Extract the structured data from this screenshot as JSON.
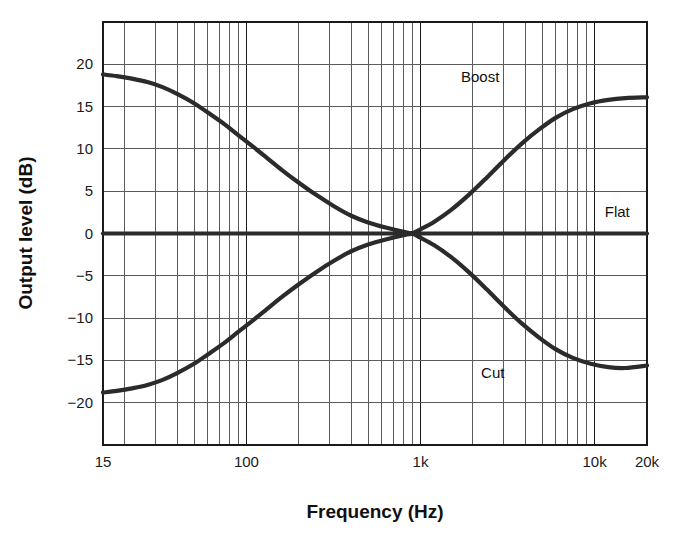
{
  "chart_data": {
    "type": "line",
    "title": "",
    "xlabel": "Frequency (Hz)",
    "ylabel": "Output level (dB)",
    "xscale": "log",
    "xlim": [
      15,
      20000
    ],
    "ylim": [
      -25,
      25
    ],
    "grid": true,
    "legend_position": "inline-annotations",
    "x_tick_labels": [
      "15",
      "100",
      "1k",
      "10k",
      "20k"
    ],
    "x_tick_values": [
      15,
      100,
      1000,
      10000,
      20000
    ],
    "y_tick_labels": [
      "20",
      "15",
      "10",
      "5",
      "0",
      "−5",
      "−10",
      "−15",
      "−20"
    ],
    "y_tick_values": [
      20,
      15,
      10,
      5,
      0,
      -5,
      -10,
      -15,
      -20
    ],
    "x_minor_gridlines": [
      20,
      30,
      40,
      50,
      60,
      70,
      80,
      90,
      200,
      300,
      400,
      500,
      600,
      700,
      800,
      900,
      2000,
      3000,
      4000,
      5000,
      6000,
      7000,
      8000,
      9000
    ],
    "annotations": [
      {
        "text": "Boost",
        "x": 2200,
        "y": 18.5
      },
      {
        "text": "Flat",
        "x": 13500,
        "y": 2.6
      },
      {
        "text": "Cut",
        "x": 2600,
        "y": -16.5
      }
    ],
    "series": [
      {
        "name": "Boost",
        "color": "#2b2b2b",
        "points": [
          [
            15,
            18.8
          ],
          [
            18,
            18.6
          ],
          [
            22,
            18.3
          ],
          [
            27,
            17.9
          ],
          [
            33,
            17.3
          ],
          [
            40,
            16.5
          ],
          [
            50,
            15.4
          ],
          [
            60,
            14.3
          ],
          [
            75,
            12.9
          ],
          [
            90,
            11.6
          ],
          [
            110,
            10.2
          ],
          [
            130,
            9.0
          ],
          [
            160,
            7.5
          ],
          [
            200,
            6.0
          ],
          [
            250,
            4.6
          ],
          [
            320,
            3.2
          ],
          [
            400,
            2.1
          ],
          [
            500,
            1.3
          ],
          [
            630,
            0.7
          ],
          [
            800,
            0.2
          ],
          [
            900,
            0.05
          ],
          [
            1000,
            0.5
          ],
          [
            1200,
            1.4
          ],
          [
            1500,
            2.8
          ],
          [
            1900,
            4.6
          ],
          [
            2400,
            6.6
          ],
          [
            3000,
            8.6
          ],
          [
            3800,
            10.6
          ],
          [
            4800,
            12.3
          ],
          [
            6000,
            13.7
          ],
          [
            7500,
            14.7
          ],
          [
            9500,
            15.4
          ],
          [
            12000,
            15.8
          ],
          [
            15000,
            16.0
          ],
          [
            20000,
            16.1
          ]
        ]
      },
      {
        "name": "Flat",
        "color": "#2b2b2b",
        "points": [
          [
            15,
            0
          ],
          [
            20000,
            0
          ]
        ]
      },
      {
        "name": "Cut",
        "color": "#2b2b2b",
        "points": [
          [
            15,
            -18.8
          ],
          [
            18,
            -18.6
          ],
          [
            22,
            -18.3
          ],
          [
            27,
            -17.9
          ],
          [
            33,
            -17.3
          ],
          [
            40,
            -16.5
          ],
          [
            50,
            -15.4
          ],
          [
            60,
            -14.3
          ],
          [
            75,
            -12.9
          ],
          [
            90,
            -11.6
          ],
          [
            110,
            -10.2
          ],
          [
            130,
            -9.0
          ],
          [
            160,
            -7.5
          ],
          [
            200,
            -6.0
          ],
          [
            250,
            -4.6
          ],
          [
            320,
            -3.2
          ],
          [
            400,
            -2.1
          ],
          [
            500,
            -1.3
          ],
          [
            630,
            -0.7
          ],
          [
            800,
            -0.2
          ],
          [
            900,
            -0.05
          ],
          [
            1000,
            -0.5
          ],
          [
            1200,
            -1.4
          ],
          [
            1500,
            -2.8
          ],
          [
            1900,
            -4.6
          ],
          [
            2400,
            -6.6
          ],
          [
            3000,
            -8.6
          ],
          [
            3800,
            -10.6
          ],
          [
            4800,
            -12.3
          ],
          [
            6000,
            -13.7
          ],
          [
            7500,
            -14.7
          ],
          [
            9500,
            -15.4
          ],
          [
            12000,
            -15.8
          ],
          [
            15000,
            -15.9
          ],
          [
            20000,
            -15.6
          ]
        ]
      }
    ],
    "colors": {
      "curve": "#2b2b2b",
      "grid": "#5a5a5a",
      "frame": "#1a1a1a",
      "background": "#ffffff",
      "text": "#111111"
    }
  }
}
